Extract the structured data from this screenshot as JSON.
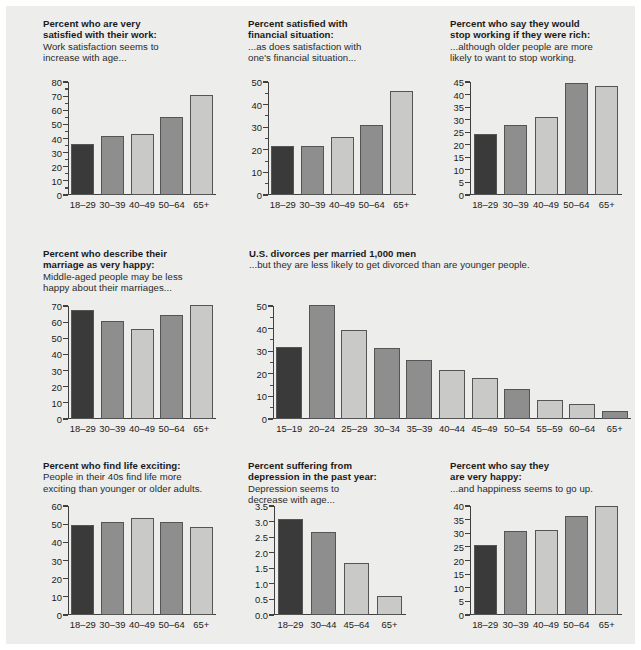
{
  "page": {
    "background": "#ededeb",
    "text_color": "#1a1a1a"
  },
  "palette": {
    "dark": "#3a3a3a",
    "mid": "#8e8e8e",
    "light": "#c9c9c7",
    "edge": "#555555",
    "axis": "#404040"
  },
  "charts": [
    {
      "id": "work-satisfaction",
      "title": "Percent who are very\nsatisfied with their work:",
      "subtitle": "Work satisfaction seems to\nincrease with age...",
      "chart_data": {
        "type": "bar",
        "title": "Percent who are very satisfied with their work:",
        "subtitle": "Work satisfaction seems to increase with age...",
        "xlabel": "",
        "ylabel": "",
        "ylim": [
          0,
          80
        ],
        "yticks": [
          0,
          10,
          20,
          30,
          40,
          50,
          60,
          70,
          80
        ],
        "minor_ticks": true,
        "grid": false,
        "legend": "none",
        "categories": [
          "18–29",
          "30–39",
          "40–49",
          "50–64",
          "65+"
        ],
        "values": [
          36,
          42,
          43,
          55,
          71
        ],
        "shades": [
          "dark",
          "mid",
          "light",
          "mid",
          "light"
        ]
      }
    },
    {
      "id": "financial-satisfaction",
      "title": "Percent satisfied with\nfinancial situation:",
      "subtitle": "...as does satisfaction with\none's financial situation...",
      "chart_data": {
        "type": "bar",
        "title": "Percent satisfied with financial situation:",
        "subtitle": "...as does satisfaction with one's financial situation...",
        "xlabel": "",
        "ylabel": "",
        "ylim": [
          0,
          50
        ],
        "yticks": [
          0,
          10,
          20,
          30,
          40,
          50
        ],
        "minor_ticks": true,
        "grid": false,
        "legend": "none",
        "categories": [
          "18–29",
          "30–39",
          "40–49",
          "50–64",
          "65+"
        ],
        "values": [
          21.5,
          21.5,
          25.5,
          31,
          46
        ],
        "shades": [
          "dark",
          "mid",
          "light",
          "mid",
          "light"
        ]
      }
    },
    {
      "id": "stop-working-if-rich",
      "title": "Percent who say they would\nstop working if they were rich:",
      "subtitle": "...although older people are more\nlikely to want to stop working.",
      "chart_data": {
        "type": "bar",
        "title": "Percent who say they would stop working if they were rich:",
        "subtitle": "...although older people are more likely to want to stop working.",
        "xlabel": "",
        "ylabel": "",
        "ylim": [
          0,
          45
        ],
        "yticks": [
          0,
          5,
          10,
          15,
          20,
          25,
          30,
          35,
          40,
          45
        ],
        "minor_ticks": false,
        "grid": false,
        "legend": "none",
        "categories": [
          "18–29",
          "30–39",
          "40–49",
          "50–64",
          "65+"
        ],
        "values": [
          24.2,
          28,
          31.2,
          44.6,
          43.4
        ],
        "shades": [
          "dark",
          "mid",
          "light",
          "mid",
          "light"
        ]
      }
    },
    {
      "id": "marriage-very-happy",
      "title": "Percent who describe their\nmarriage as very happy:",
      "subtitle": "Middle-aged people may be less\nhappy about their marriages...",
      "chart_data": {
        "type": "bar",
        "title": "Percent who describe their marriage as very happy:",
        "subtitle": "Middle-aged people may be less happy about their marriages...",
        "xlabel": "",
        "ylabel": "",
        "ylim": [
          0,
          70
        ],
        "yticks": [
          0,
          10,
          20,
          30,
          40,
          50,
          60,
          70
        ],
        "minor_ticks": false,
        "grid": false,
        "legend": "none",
        "categories": [
          "18–29",
          "30–39",
          "40–49",
          "50–64",
          "65+"
        ],
        "values": [
          67.5,
          61,
          55.5,
          64.5,
          70.5
        ],
        "shades": [
          "dark",
          "mid",
          "light",
          "mid",
          "light"
        ]
      }
    },
    {
      "id": "us-divorces",
      "title": "U.S. divorces per married 1,000 men",
      "subtitle": "...but they are less likely to get divorced than are younger people.",
      "chart_data": {
        "type": "bar",
        "title": "U.S. divorces per married 1,000 men",
        "subtitle": "...but they are less likely to get divorced than are younger people.",
        "xlabel": "",
        "ylabel": "",
        "ylim": [
          0,
          50
        ],
        "yticks": [
          0,
          10,
          20,
          30,
          40,
          50
        ],
        "minor_ticks": true,
        "grid": false,
        "legend": "none",
        "categories": [
          "15–19",
          "20–24",
          "25–29",
          "30–34",
          "35–39",
          "40–44",
          "45–49",
          "50–54",
          "55–59",
          "60–64",
          "65+"
        ],
        "values": [
          32,
          50.5,
          39.5,
          31.5,
          26,
          21.5,
          18,
          13.5,
          8.5,
          6.5,
          3.5
        ],
        "shades": [
          "dark",
          "mid",
          "light",
          "mid",
          "mid",
          "light",
          "light",
          "mid",
          "light",
          "light",
          "mid"
        ]
      }
    },
    {
      "id": "life-exciting",
      "title": "Percent who find life exciting:",
      "subtitle": "People in their 40s find life more\nexciting than younger or older adults.",
      "chart_data": {
        "type": "bar",
        "title": "Percent who find life exciting:",
        "subtitle": "People in their 40s find life more exciting than younger or older adults.",
        "xlabel": "",
        "ylabel": "",
        "ylim": [
          0,
          60
        ],
        "yticks": [
          0,
          10,
          20,
          30,
          40,
          50,
          60
        ],
        "minor_ticks": false,
        "grid": false,
        "legend": "none",
        "categories": [
          "18–29",
          "30–39",
          "40–49",
          "50–64",
          "65+"
        ],
        "values": [
          49.3,
          51.3,
          53.6,
          51.1,
          48.7
        ],
        "shades": [
          "dark",
          "mid",
          "light",
          "mid",
          "light"
        ]
      }
    },
    {
      "id": "depression",
      "title": "Percent suffering from\ndepression in the past year:",
      "subtitle": "Depression seems to\ndecrease with age...",
      "chart_data": {
        "type": "bar",
        "title": "Percent suffering from depression in the past year:",
        "subtitle": "Depression seems to decrease with age...",
        "xlabel": "",
        "ylabel": "",
        "ylim": [
          0.0,
          3.5
        ],
        "yticks": [
          0.0,
          0.5,
          1.0,
          1.5,
          2.0,
          2.5,
          3.0,
          3.5
        ],
        "ytick_labels": [
          "0.0",
          "0.5",
          "1.0",
          "1.5",
          "2.0",
          "2.5",
          "3.0",
          "3.5"
        ],
        "minor_ticks": false,
        "grid": false,
        "legend": "none",
        "categories": [
          "18–29",
          "30–44",
          "45–64",
          "65+"
        ],
        "values": [
          3.08,
          2.65,
          1.67,
          0.6
        ],
        "shades": [
          "dark",
          "mid",
          "light",
          "light"
        ]
      }
    },
    {
      "id": "very-happy",
      "title": "Percent who say they\nare very happy:",
      "subtitle": "...and happiness seems to go up.",
      "chart_data": {
        "type": "bar",
        "title": "Percent who say they are very happy:",
        "subtitle": "...and happiness seems to go up.",
        "xlabel": "",
        "ylabel": "",
        "ylim": [
          0,
          40
        ],
        "yticks": [
          0,
          5,
          10,
          15,
          20,
          25,
          30,
          35,
          40
        ],
        "minor_ticks": false,
        "grid": false,
        "legend": "none",
        "categories": [
          "18–29",
          "30–39",
          "40–49",
          "50–64",
          "65+"
        ],
        "values": [
          25.8,
          30.9,
          31.3,
          36.2,
          40
        ],
        "shades": [
          "dark",
          "mid",
          "light",
          "mid",
          "light"
        ]
      }
    }
  ]
}
